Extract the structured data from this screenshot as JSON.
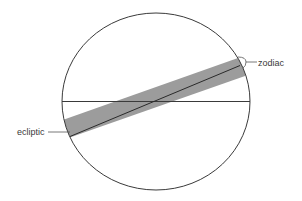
{
  "diagram": {
    "title": "",
    "labels": {
      "zodiac": "zodiac",
      "ecliptic": "ecliptic"
    },
    "colors": {
      "background": "#ffffff",
      "outline": "#3a3a3a",
      "band": "#9c9c9c",
      "text": "#3a3a3a"
    },
    "elements": [
      {
        "id": "celestial-sphere",
        "type": "circle",
        "description": "outer circle representing the celestial sphere"
      },
      {
        "id": "celestial-equator",
        "type": "line",
        "description": "horizontal line across the circle"
      },
      {
        "id": "zodiac-band",
        "type": "band",
        "description": "tilted gray band around the ecliptic",
        "label": "zodiac"
      },
      {
        "id": "ecliptic-line",
        "type": "line",
        "description": "tilted line through the center of the band",
        "label": "ecliptic"
      }
    ]
  }
}
